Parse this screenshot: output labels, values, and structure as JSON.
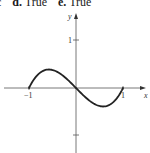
{
  "header": {
    "items": [
      {
        "letter": "c",
        "answer": ""
      },
      {
        "letter": "d.",
        "answer": "True"
      },
      {
        "letter": "e.",
        "answer": "True"
      }
    ]
  },
  "chart_data": {
    "type": "line",
    "title": "",
    "xlabel": "x",
    "ylabel": "y",
    "x_ticks": [
      "-1",
      "1"
    ],
    "y_ticks": [
      "1",
      "-1"
    ],
    "y_tick_labels_visible": [
      "1"
    ],
    "xlim": [
      -1.5,
      1.5
    ],
    "ylim": [
      -1.1,
      1.1
    ],
    "grid": false,
    "legend": null,
    "series": [
      {
        "name": "f(x)",
        "description": "cubic curve through (-1,0), (0,0), (1,0); local max near x=-0.58, local min near x=0.58",
        "x": [
          -1.0,
          -0.8,
          -0.58,
          -0.4,
          -0.2,
          0.0,
          0.2,
          0.4,
          0.58,
          0.8,
          1.0
        ],
        "y": [
          0.0,
          0.29,
          0.385,
          0.34,
          0.19,
          0.0,
          -0.19,
          -0.34,
          -0.385,
          -0.29,
          0.0
        ]
      }
    ]
  },
  "labels": {
    "x_axis": "x",
    "y_axis": "y",
    "x_tick_neg1": "−1",
    "x_tick_pos1": "1",
    "y_tick_pos1": "1"
  }
}
